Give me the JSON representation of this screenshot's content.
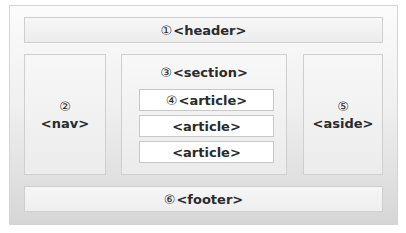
{
  "diagram": {
    "header": {
      "number": "①",
      "label": "<header>"
    },
    "nav": {
      "number": "②",
      "label": "<nav>"
    },
    "section": {
      "number": "③",
      "label": "<section>",
      "articles": [
        {
          "number": "④",
          "label": "<article>"
        },
        {
          "number": "",
          "label": "<article>"
        },
        {
          "number": "",
          "label": "<article>"
        }
      ]
    },
    "aside": {
      "number": "⑤",
      "label": "<aside>"
    },
    "footer": {
      "number": "⑥",
      "label": "<footer>"
    }
  },
  "colors": {
    "frame_border": "#d4d4d4",
    "box_border": "#cfcfcf",
    "text": "#2a2a2a",
    "article_bg": "#ffffff"
  }
}
